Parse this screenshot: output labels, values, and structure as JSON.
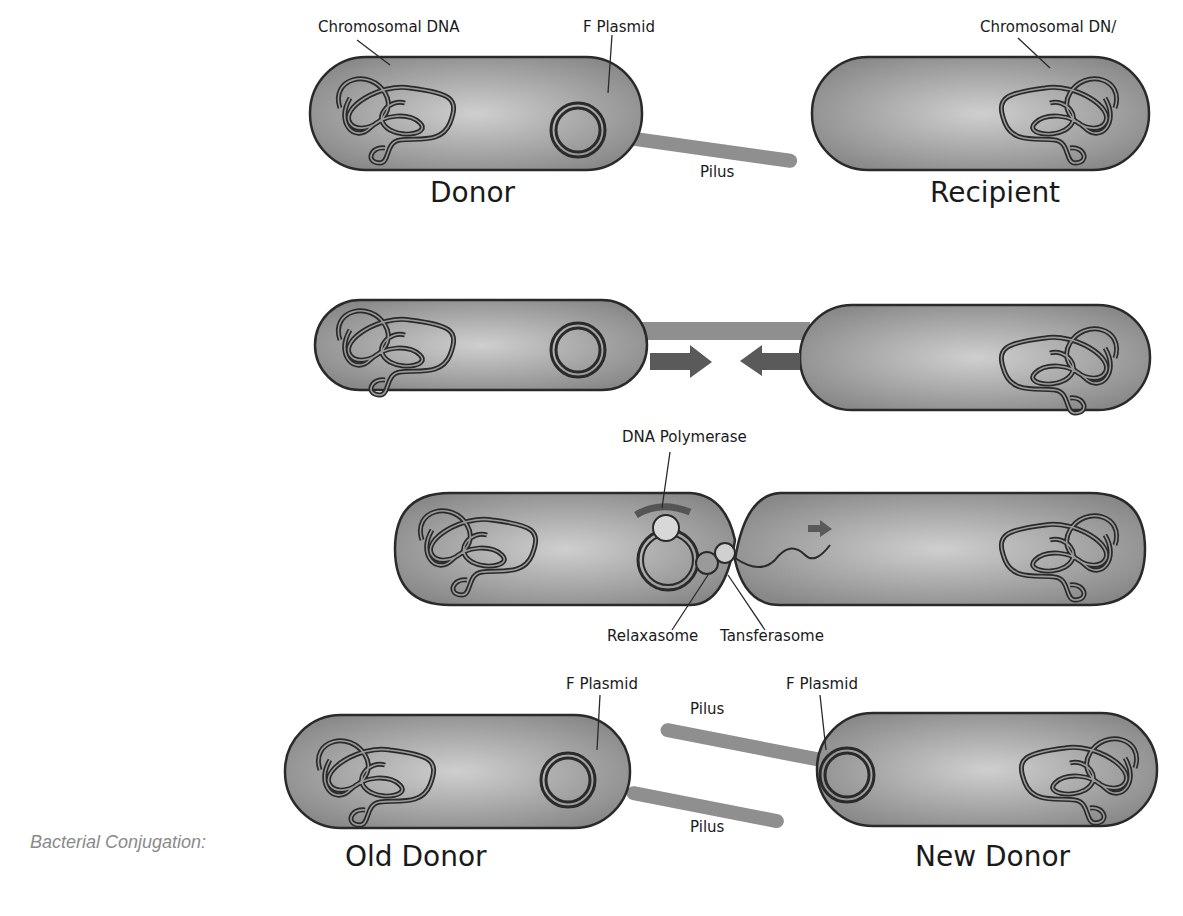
{
  "caption": "Bacterial Conjugation:",
  "stage1": {
    "labels": {
      "chromosomal_dna_left": "Chromosomal DNA",
      "f_plasmid": "F Plasmid",
      "chromosomal_dna_right": "Chromosomal DN/",
      "pilus": "Pilus",
      "donor": "Donor",
      "recipient": "Recipient"
    }
  },
  "stage2": {
    "description": "Pilus attaches; cells drawn together",
    "arrows": [
      "right-arrow",
      "left-arrow"
    ]
  },
  "stage3": {
    "labels": {
      "dna_polymerase": "DNA Polymerase",
      "relaxasome": "Relaxasome",
      "transferasome": "Tansferasome"
    }
  },
  "stage4": {
    "labels": {
      "f_plasmid_left": "F Plasmid",
      "f_plasmid_right": "F Plasmid",
      "pilus_top": "Pilus",
      "pilus_bottom": "Pilus",
      "old_donor": "Old Donor",
      "new_donor": "New Donor"
    }
  },
  "colors": {
    "cell_fill_center": "#c8c8c8",
    "cell_fill_edge": "#8c8c8c",
    "outline": "#2a2a2a",
    "pilus": "#8f8f8f",
    "arrow": "#5a5a5a",
    "caption": "#8a8a8a"
  }
}
